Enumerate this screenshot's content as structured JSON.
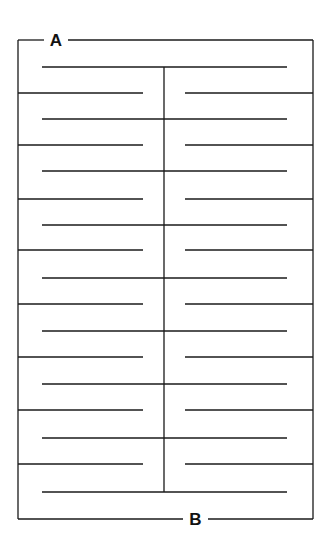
{
  "diagram": {
    "type": "maze",
    "start_label": "A",
    "end_label": "B",
    "stroke_color": "#1a1a1a",
    "background": "#ffffff",
    "frame": {
      "left": 18,
      "right": 313,
      "top": 40,
      "bottom": 519
    },
    "top_gap": {
      "x1": 44,
      "x2": 68
    },
    "bottom_gap": {
      "x1": 183,
      "x2": 208
    },
    "spine": {
      "x": 164,
      "y1": 67,
      "y2": 492
    },
    "center_lines": {
      "x1": 42,
      "x2": 287,
      "y": [
        67,
        119,
        171,
        225,
        278,
        331,
        384,
        438,
        492
      ]
    },
    "wall_pairs": {
      "left": {
        "x1": 18,
        "x2": 143
      },
      "right": {
        "x1": 185,
        "x2": 313
      },
      "y": [
        93,
        145,
        199,
        250,
        304,
        357,
        410,
        464
      ]
    }
  }
}
